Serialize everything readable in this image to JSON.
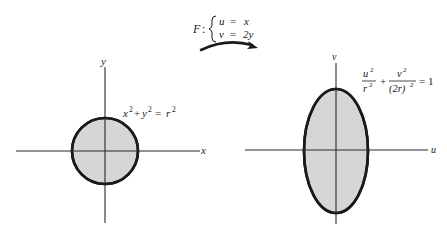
{
  "figure": {
    "colors": {
      "ink": "#1a1a1a",
      "fill": "#d4d4d4",
      "background": "#ffffff"
    }
  },
  "mapping": {
    "name": "F",
    "separator": ":",
    "equations": [
      {
        "lhs": "u",
        "op": "=",
        "rhs": "x"
      },
      {
        "lhs": "v",
        "op": "=",
        "rhs": "2y"
      }
    ]
  },
  "left_panel": {
    "x_axis_label": "x",
    "y_axis_label": "y",
    "equation": {
      "term1": "x",
      "exp1": "2",
      "plus": "+",
      "term2": "y",
      "exp2": "2",
      "equals": "=",
      "rhs": "r",
      "exp3": "2"
    },
    "shape": {
      "type": "circle",
      "cx": 105,
      "cy": 151,
      "r": 33
    }
  },
  "right_panel": {
    "x_axis_label": "u",
    "y_axis_label": "v",
    "equation": {
      "num1": "u",
      "num1_exp": "2",
      "den1": "r",
      "den1_exp": "2",
      "plus": "+",
      "num2": "v",
      "num2_exp": "2",
      "den2": "(2r)",
      "den2_exp": "2",
      "equals": "=",
      "rhs": "1"
    },
    "shape": {
      "type": "ellipse",
      "cx": 336,
      "cy": 151,
      "rx": 32,
      "ry": 62
    }
  }
}
